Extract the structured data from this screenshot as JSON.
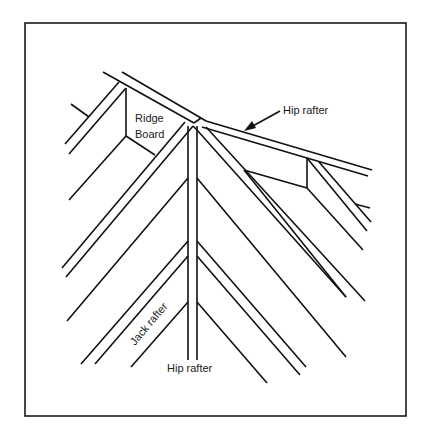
{
  "figure": {
    "type": "line-drawing",
    "colors": {
      "background": "#ffffff",
      "stroke": "#111111"
    }
  },
  "labels": {
    "ridge_board_line1": "Ridge",
    "ridge_board_line2": "Board",
    "hip_rafter_top": "Hip rafter",
    "hip_rafter_bottom": "Hip rafter",
    "jack_rafter": "Jack rafter"
  },
  "annotations": [
    {
      "label": "Hip rafter",
      "pointer": "arrow",
      "target": "upper-right hip rafter"
    },
    {
      "label": "Ridge Board",
      "pointer": "none",
      "target": "ridge board"
    },
    {
      "label": "Hip rafter",
      "pointer": "none",
      "target": "vertical hip rafter"
    },
    {
      "label": "Jack rafter",
      "pointer": "none",
      "target": "jack rafter, rotated along slope"
    }
  ]
}
